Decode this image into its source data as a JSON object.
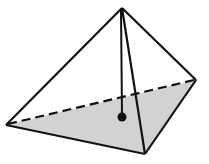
{
  "figure": {
    "type": "square-pyramid",
    "colors": {
      "background": "#ffffff",
      "stroke": "#111111",
      "base_fill": "#d2d2d2",
      "center_dot": "#111111"
    },
    "vertices": {
      "apex": [
        122,
        8
      ],
      "left": [
        6,
        125
      ],
      "front": [
        145,
        154
      ],
      "right": [
        196,
        80
      ]
    },
    "base_center": [
      122,
      117
    ]
  }
}
